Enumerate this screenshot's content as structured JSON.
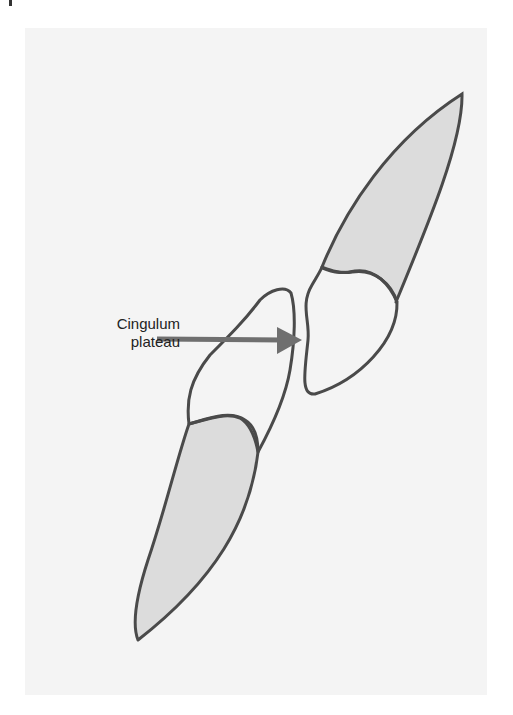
{
  "figure": {
    "label": {
      "line1": "Cingulum",
      "line2": "plateau"
    },
    "colors": {
      "background_panel": "#f4f4f4",
      "outline": "#4a4a4a",
      "enamel_fill": "#dcdcdc",
      "arrow": "#6f6f6f",
      "text": "#222222"
    },
    "elements": [
      {
        "name": "upper-tooth",
        "description": "Upper incisor sketch (crown shaded, root unshaded)"
      },
      {
        "name": "lower-tooth",
        "description": "Lower incisor sketch (crown shaded, root unshaded)"
      },
      {
        "name": "arrow",
        "description": "Arrow from label pointing to cingulum plateau"
      }
    ]
  }
}
